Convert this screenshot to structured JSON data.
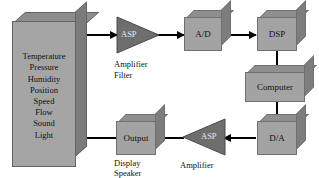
{
  "diagram": {
    "colors": {
      "box_face": "#a3a3a3",
      "box_top": "#8f8f8f",
      "box_side": "#7d7d7d",
      "triangle": "#6e6e6e",
      "arrow": "#000000",
      "background": "#ffffff"
    },
    "sensor_block": {
      "name": "sensor-input-block",
      "items": [
        "Temperature",
        "Pressure",
        "Humidity",
        "Position",
        "Speed",
        "Flow",
        "Sound",
        "Light"
      ]
    },
    "nodes": {
      "asp_input": {
        "label": "ASP",
        "caption_line1": "Amplifier",
        "caption_line2": "Filter",
        "direction": "right"
      },
      "adc": {
        "label": "A/D"
      },
      "dsp": {
        "label": "DSP"
      },
      "computer": {
        "label": "Computer"
      },
      "dac": {
        "label": "D/A"
      },
      "asp_output": {
        "label": "ASP",
        "caption_line1": "Amplifier",
        "direction": "left"
      },
      "output": {
        "label": "Output",
        "caption_line1": "Display",
        "caption_line2": "Speaker"
      }
    },
    "connections": [
      {
        "from": "sensor-input-block",
        "to": "asp_input",
        "direction": "right"
      },
      {
        "from": "asp_input",
        "to": "adc",
        "direction": "right"
      },
      {
        "from": "adc",
        "to": "dsp",
        "direction": "right"
      },
      {
        "from": "dsp",
        "to": "computer",
        "direction": "down"
      },
      {
        "from": "computer",
        "to": "dac",
        "direction": "down"
      },
      {
        "from": "dac",
        "to": "asp_output",
        "direction": "left"
      },
      {
        "from": "asp_output",
        "to": "output",
        "direction": "left"
      },
      {
        "from": "output",
        "to": "sensor-input-block",
        "direction": "left"
      }
    ]
  }
}
